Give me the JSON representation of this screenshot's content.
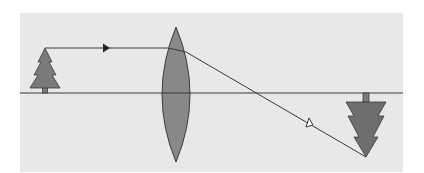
{
  "diagram": {
    "type": "optics-ray-diagram",
    "colors": {
      "page_background": "#ffffff",
      "panel_background": "#e8e8e8",
      "stroke": "#3a3a3a",
      "object_fill": "#7a7a7a",
      "lens_fill": "#888888",
      "image_fill": "#6e6e6e",
      "open_arrow_fill": "#ffffff"
    },
    "panel": {
      "x": 20,
      "y": 13,
      "width": 383,
      "height": 159
    },
    "optical_axis": {
      "y": 93,
      "x1": 20,
      "x2": 403
    },
    "lens": {
      "label": "converging lens",
      "cx": 176,
      "top": 27,
      "bottom": 162,
      "half_width": 14
    },
    "object": {
      "label": "upright object (tree)",
      "x": 45,
      "apex_y": 48,
      "base_y": 93
    },
    "image": {
      "label": "inverted real image (tree)",
      "x": 366,
      "tip_y": 157,
      "base_y": 93
    },
    "rays": [
      {
        "name": "parallel-ray-incident",
        "from": [
          45,
          48
        ],
        "to": [
          166,
          48
        ],
        "arrow": "filled",
        "arrow_at": [
          105,
          48
        ]
      },
      {
        "name": "parallel-ray-refracted",
        "from": [
          166,
          48
        ],
        "via": [
          186,
          52
        ],
        "to": [
          366,
          157
        ],
        "arrow": "open",
        "arrow_at": [
          308,
          124
        ]
      }
    ]
  }
}
